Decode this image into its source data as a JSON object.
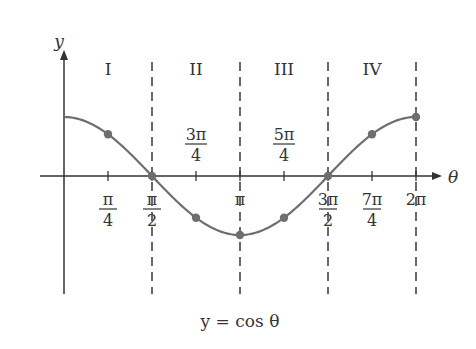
{
  "chart_data": {
    "type": "line",
    "title": "",
    "caption": "y = cos θ",
    "xlabel": "θ",
    "ylabel": "y",
    "xlim": [
      0,
      6.2832
    ],
    "ylim": [
      -1,
      1
    ],
    "grid": false,
    "legend": null,
    "function": "cos",
    "series": [
      {
        "name": "y = cos θ",
        "points": [
          {
            "x": 0,
            "x_label": "0",
            "y": 1,
            "marked": false
          },
          {
            "x": 0.7854,
            "x_label": "π/4",
            "y": 0.7071,
            "marked": true
          },
          {
            "x": 1.5708,
            "x_label": "π/2",
            "y": 0,
            "marked": true
          },
          {
            "x": 2.3562,
            "x_label": "3π/4",
            "y": -0.7071,
            "marked": true
          },
          {
            "x": 3.1416,
            "x_label": "π",
            "y": -1,
            "marked": true
          },
          {
            "x": 3.927,
            "x_label": "5π/4",
            "y": -0.7071,
            "marked": true
          },
          {
            "x": 4.7124,
            "x_label": "3π/2",
            "y": 0,
            "marked": true
          },
          {
            "x": 5.4978,
            "x_label": "7π/4",
            "y": 0.7071,
            "marked": true
          },
          {
            "x": 6.2832,
            "x_label": "2π",
            "y": 1,
            "marked": true
          }
        ]
      }
    ],
    "x_ticks": [
      {
        "value": 0.7854,
        "num": "π",
        "den": "4",
        "position": "below"
      },
      {
        "value": 1.5708,
        "num": "π",
        "den": "2",
        "position": "below"
      },
      {
        "value": 2.3562,
        "num": "3π",
        "den": "4",
        "position": "above"
      },
      {
        "value": 3.1416,
        "num": "π",
        "den": "",
        "position": "below"
      },
      {
        "value": 3.927,
        "num": "5π",
        "den": "4",
        "position": "above"
      },
      {
        "value": 4.7124,
        "num": "3π",
        "den": "2",
        "position": "below"
      },
      {
        "value": 5.4978,
        "num": "7π",
        "den": "4",
        "position": "below"
      },
      {
        "value": 6.2832,
        "num": "2π",
        "den": "",
        "position": "below"
      }
    ],
    "quadrants": [
      "I",
      "II",
      "III",
      "IV"
    ],
    "dashed_dividers_at": [
      1.5708,
      3.1416,
      4.7124,
      6.2832
    ]
  },
  "labels": {
    "y_axis": "y",
    "x_axis": "θ",
    "caption": "y = cos θ",
    "quadrant_1": "I",
    "quadrant_2": "II",
    "quadrant_3": "III",
    "quadrant_4": "IV"
  },
  "colors": {
    "axis": "#333333",
    "curve": "#6e6e6e",
    "marker": "#6e6e6e",
    "text": "#333333"
  }
}
